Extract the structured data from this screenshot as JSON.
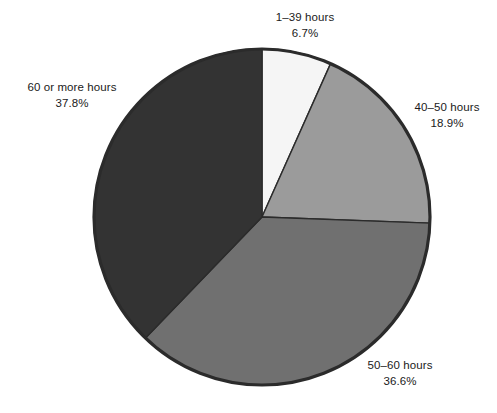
{
  "chart_data": {
    "type": "pie",
    "title": "",
    "subtitle": "",
    "xlabel": "",
    "ylabel": "",
    "legend_position": "none",
    "grid": false,
    "unit": "%",
    "start_angle_deg": 0,
    "direction": "clockwise",
    "categories": [
      "1–39 hours",
      "40–50 hours",
      "50–60 hours",
      "60 or more hours"
    ],
    "values": [
      6.7,
      18.9,
      36.6,
      37.8
    ],
    "value_labels": [
      "6.7%",
      "18.9%",
      "36.6%",
      "37.8%"
    ],
    "colors": [
      "#f5f5f5",
      "#9b9b9b",
      "#707070",
      "#333333"
    ],
    "slices": [
      {
        "label": "1–39 hours",
        "value": 6.7,
        "value_label": "6.7%",
        "color": "#f5f5f5",
        "start_deg": 0.0,
        "end_deg": 24.1
      },
      {
        "label": "40–50 hours",
        "value": 18.9,
        "value_label": "18.9%",
        "color": "#9b9b9b",
        "start_deg": 24.1,
        "end_deg": 92.1
      },
      {
        "label": "50–60 hours",
        "value": 36.6,
        "value_label": "36.6%",
        "color": "#707070",
        "start_deg": 92.1,
        "end_deg": 223.9
      },
      {
        "label": "60 or more hours",
        "value": 37.8,
        "value_label": "37.8%",
        "color": "#333333",
        "start_deg": 223.9,
        "end_deg": 360.0
      }
    ]
  },
  "labels": {
    "top": {
      "name": "1–39 hours",
      "value": "6.7%"
    },
    "right": {
      "name": "40–50 hours",
      "value": "18.9%"
    },
    "bottom": {
      "name": "50–60 hours",
      "value": "36.6%"
    },
    "left": {
      "name": "60 or more hours",
      "value": "37.8%"
    }
  },
  "style": {
    "background": "#ffffff",
    "text_color": "#1a1a1a",
    "rim_color": "#2b2b2b",
    "separator_color": "#2b2b2b"
  },
  "geometry": {
    "center_x": 262,
    "center_y": 217,
    "radius": 168
  }
}
